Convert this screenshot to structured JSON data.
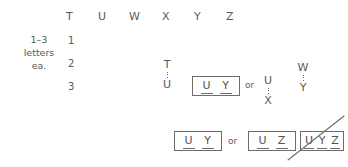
{
  "diagram": {
    "side_label": {
      "line1": "1–3",
      "line2": "letters",
      "line3": "ea."
    },
    "column_headers": [
      "T",
      "U",
      "W",
      "X",
      "Y",
      "Z"
    ],
    "row_numbers": [
      "1",
      "2",
      "3"
    ],
    "stacks": [
      {
        "top": "T",
        "bottom": "U"
      },
      {
        "top": "U",
        "bottom": "X"
      },
      {
        "top": "W",
        "bottom": "Y"
      }
    ],
    "connectors": {
      "or_middle": "or",
      "or_bottom": "or"
    },
    "boxes": [
      {
        "letters": [
          "U",
          "Y"
        ],
        "crossed_out": false
      },
      {
        "letters": [
          "U",
          "Y"
        ],
        "crossed_out": false
      },
      {
        "letters": [
          "U",
          "Z"
        ],
        "crossed_out": false
      },
      {
        "letters": [
          "U",
          "Y",
          "Z"
        ],
        "crossed_out": true
      }
    ],
    "colors": {
      "ink": "#5c5956",
      "rule": "#6e6b68",
      "background": "#ffffff"
    }
  }
}
